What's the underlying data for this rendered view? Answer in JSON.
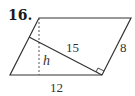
{
  "problem": {
    "number": "16."
  },
  "figure": {
    "shape": "parallelogram",
    "labels": {
      "diagonal_perpendicular": "15",
      "side": "8",
      "height": "h",
      "base": "12"
    },
    "colors": {
      "stroke": "#333333",
      "background": "#ffffff"
    }
  }
}
